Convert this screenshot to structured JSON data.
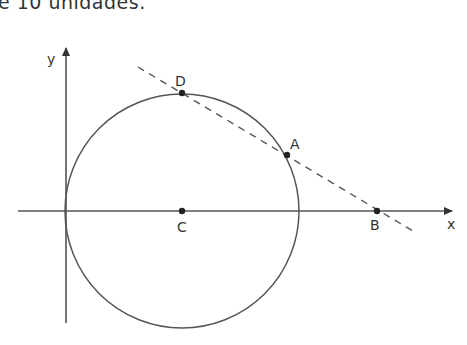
{
  "header": {
    "truncated_text": "é 10 unidades."
  },
  "diagram": {
    "type": "geometry",
    "axes": {
      "x_label": "x",
      "y_label": "y"
    },
    "circle": {
      "center_label": "C",
      "description": "circle centered at C on x-axis, tangent to y-axis at origin"
    },
    "points": [
      {
        "label": "D",
        "description": "top of circle, on dashed line"
      },
      {
        "label": "A",
        "description": "on circle and dashed line"
      },
      {
        "label": "B",
        "description": "intersection of dashed line with x-axis"
      },
      {
        "label": "C",
        "description": "center of circle on x-axis"
      }
    ],
    "line": {
      "style": "dashed",
      "through": [
        "D",
        "A",
        "B"
      ]
    },
    "colors": {
      "stroke": "#444444",
      "text": "#333333"
    }
  }
}
